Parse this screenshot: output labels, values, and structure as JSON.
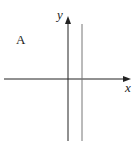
{
  "diagram": {
    "panel_label": "A",
    "x_axis_label": "x",
    "y_axis_label": "y",
    "elements": [
      {
        "type": "axis",
        "direction": "horizontal",
        "arrow": "right"
      },
      {
        "type": "axis",
        "direction": "vertical",
        "arrow": "up"
      },
      {
        "type": "line",
        "description": "vertical line x = a (a > 0), right of y-axis"
      }
    ],
    "colors": {
      "axes": "#222222",
      "line": "#777777"
    }
  }
}
